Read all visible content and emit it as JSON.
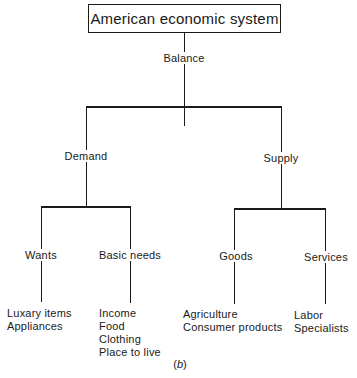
{
  "diagram": {
    "title": "American economic system",
    "connector_label": "Balance",
    "branches": [
      {
        "label": "Demand",
        "children": [
          {
            "label": "Wants",
            "items": [
              "Luxary items",
              "Appliances"
            ]
          },
          {
            "label": "Basic needs",
            "items": [
              "Income",
              "Food",
              "Clothing",
              "Place to live"
            ]
          }
        ]
      },
      {
        "label": "Supply",
        "children": [
          {
            "label": "Goods",
            "items": [
              "Agriculture",
              "Consumer products"
            ]
          },
          {
            "label": "Services",
            "items": [
              "Labor",
              "Specialists"
            ]
          }
        ]
      }
    ],
    "caption_open": "(",
    "caption_letter": "b",
    "caption_close": ")"
  },
  "colors": {
    "line": "#1a1a1a",
    "background": "#ffffff"
  }
}
